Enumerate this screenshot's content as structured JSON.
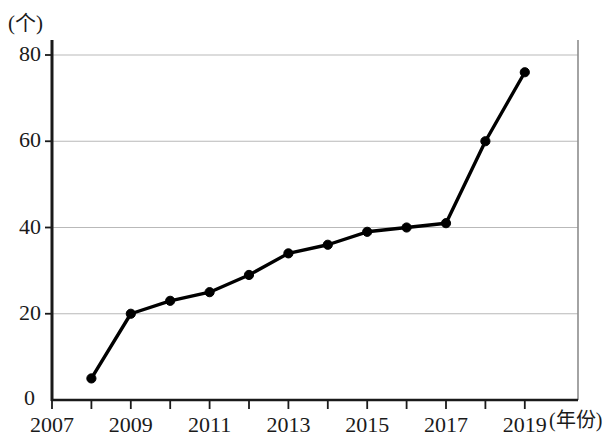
{
  "chart_data": {
    "type": "line",
    "title": "",
    "subtitle": "",
    "xlabel": "年份",
    "ylabel": "个",
    "x": [
      2008,
      2009,
      2010,
      2011,
      2012,
      2013,
      2014,
      2015,
      2016,
      2017,
      2018,
      2019
    ],
    "values": [
      5,
      20,
      23,
      25,
      29,
      34,
      36,
      39,
      40,
      41,
      60,
      76
    ],
    "series": [
      {
        "name": "",
        "values": [
          5,
          20,
          23,
          25,
          29,
          34,
          36,
          39,
          40,
          41,
          60,
          76
        ]
      }
    ],
    "xlim": [
      2007,
      2020
    ],
    "ylim": [
      0,
      84
    ],
    "x_ticks": [
      2007,
      2008,
      2009,
      2010,
      2011,
      2012,
      2013,
      2014,
      2015,
      2016,
      2017,
      2018,
      2019
    ],
    "x_tick_labels": [
      "2007",
      "",
      "2009",
      "",
      "2011",
      "",
      "2013",
      "",
      "2015",
      "",
      "2017",
      "",
      "2019"
    ],
    "y_ticks": [
      0,
      20,
      40,
      60,
      80
    ],
    "y_tick_labels": [
      "0",
      "20",
      "40",
      "60",
      "80"
    ],
    "gridlines": "horizontal",
    "legend": "none",
    "marker": "filled-circle",
    "line_color": "#000000",
    "grid_color": "#b9b9b9",
    "axis_color": "#1a1a1a",
    "background": "#ffffff"
  },
  "axes": {
    "y_unit_label": "(个)",
    "x_unit_label": "(年份)",
    "origin_label": "0"
  }
}
